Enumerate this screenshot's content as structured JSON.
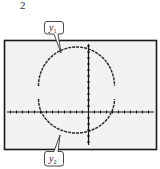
{
  "figure": {
    "number": "2"
  },
  "chart_data": {
    "type": "line",
    "title": "",
    "xlabel": "",
    "ylabel": "",
    "grid": false,
    "axes": {
      "x_ticks_left_of_origin": 13,
      "x_ticks_right_of_origin": 10,
      "y_ticks_above_origin": 11,
      "y_ticks_below_origin": 5
    },
    "circle": {
      "center_x_ticks": -2,
      "center_y_ticks": 3,
      "radius_ticks": 6.4
    },
    "series": [
      {
        "name": "y1",
        "label": "y1",
        "part": "upper semicircle"
      },
      {
        "name": "y2",
        "label": "y2",
        "part": "lower semicircle"
      }
    ],
    "legend": {
      "position": "callouts",
      "entries": [
        "y1",
        "y2"
      ]
    }
  },
  "callouts": {
    "y1": {
      "base": "y",
      "sub": "1"
    },
    "y2": {
      "base": "y",
      "sub": "2"
    }
  },
  "colors": {
    "frame": "#1a1a1a",
    "screen": "#f2f2f2",
    "curve": "#222222",
    "axis": "#111111"
  }
}
